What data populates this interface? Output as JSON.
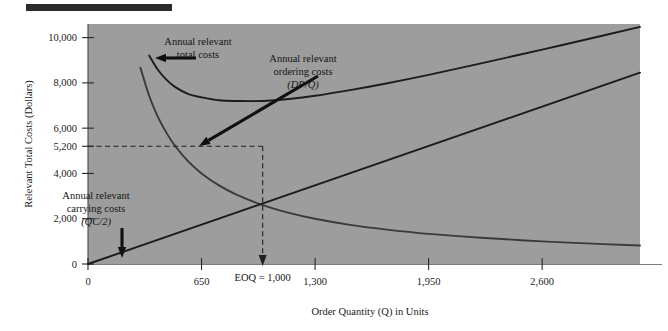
{
  "figure": {
    "background_color": "#9d9d9d",
    "page_color": "#ffffff",
    "rule_color": "#2b2b2b"
  },
  "chart_data": {
    "type": "line",
    "title": "",
    "subtitle": "",
    "xlabel": "Order Quantity (Q) in Units",
    "ylabel": "Relevant Total Costs (Dollars)",
    "xlim": [
      0,
      3160
    ],
    "ylim": [
      0,
      10600
    ],
    "grid": false,
    "legend_position": "none",
    "xticks": [
      0,
      650,
      1300,
      1950,
      2600
    ],
    "xtick_labels": [
      "0",
      "650",
      "1,300",
      "1,950",
      "2,600"
    ],
    "yticks": [
      0,
      2000,
      4000,
      5200,
      6000,
      8000,
      10000
    ],
    "ytick_labels": [
      "0",
      "2,000",
      "4,000",
      "5,200",
      "6,000",
      "8,000",
      "10,000"
    ],
    "series": [
      {
        "name": "Annual relevant total costs",
        "formula": "DP/Q + QC/2",
        "color": "#1c1c1c",
        "x": [
          350,
          400,
          450,
          500,
          575,
          650,
          750,
          850,
          1000,
          1150,
          1300,
          1500,
          1700,
          1950,
          2250,
          2600,
          2950,
          3160
        ],
        "y": [
          9210,
          8580,
          8130,
          7810,
          7500,
          7360,
          7230,
          7200,
          7200,
          7290,
          7430,
          7680,
          7960,
          8350,
          8860,
          9470,
          10090,
          10470
        ]
      },
      {
        "name": "Annual relevant ordering costs",
        "formula": "DP/Q",
        "color": "#3a3a3a",
        "x": [
          300,
          350,
          400,
          450,
          500,
          575,
          650,
          750,
          850,
          1000,
          1150,
          1300,
          1500,
          1700,
          1950,
          2250,
          2600,
          2950,
          3160
        ],
        "y": [
          8670,
          7430,
          6500,
          5780,
          5200,
          4520,
          4000,
          3470,
          3060,
          2600,
          2260,
          2000,
          1730,
          1530,
          1330,
          1160,
          1000,
          880,
          820
        ]
      },
      {
        "name": "Annual relevant carrying costs",
        "formula": "QC/2",
        "color": "#1c1c1c",
        "x": [
          0,
          3160
        ],
        "y": [
          0,
          8450
        ]
      }
    ],
    "annotations": [
      {
        "name": "total-costs-annotation",
        "lines": [
          "Annual relevant",
          "total costs"
        ],
        "italic_line": "",
        "text_x": 198,
        "text_y": 45,
        "arrow": {
          "x1": 196,
          "y1": 58,
          "x2": 155,
          "y2": 58
        }
      },
      {
        "name": "ordering-costs-annotation",
        "lines": [
          "Annual relevant",
          "ordering costs"
        ],
        "italic_line": "(DP/Q)",
        "text_x": 303,
        "text_y": 62,
        "arrow": {
          "x1": 318,
          "y1": 76,
          "x2": 199,
          "y2": 146
        }
      },
      {
        "name": "carrying-costs-annotation",
        "lines": [
          "Annual relevant",
          "carrying costs"
        ],
        "italic_line": "(QC/2)",
        "text_x": 96,
        "text_y": 199,
        "arrow": {
          "x1": 122,
          "y1": 228,
          "x2": 122,
          "y2": 258
        }
      }
    ],
    "markers": {
      "eoq_label": "EOQ = 1,000",
      "eoq_x": 1000,
      "eoq_cost": 5200,
      "guide_color": "#202020"
    }
  }
}
